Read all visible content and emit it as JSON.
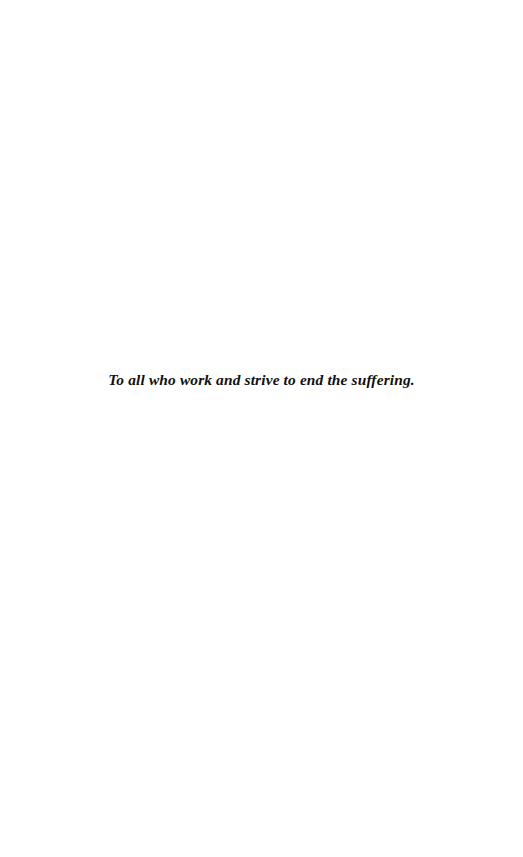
{
  "page": {
    "kind": "book-dedication-page",
    "background_color": "#ffffff",
    "text_color": "#111111",
    "width_px": 523,
    "height_px": 857
  },
  "dedication": {
    "text": "To all who work and strive to end the suffering."
  }
}
